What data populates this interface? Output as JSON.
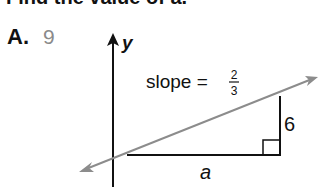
{
  "question": {
    "header_text": "Find the value of a.",
    "choice": {
      "letter": "A.",
      "value": "9"
    }
  },
  "figure": {
    "axis_label": "y",
    "slope_label": "slope =",
    "slope_numerator": "2",
    "slope_denominator": "3",
    "rise_label": "6",
    "run_label": "a",
    "colors": {
      "line": "#8c8c8c",
      "axis": "#111111",
      "triangle": "#111111",
      "answer": "#8a8a8a"
    }
  }
}
